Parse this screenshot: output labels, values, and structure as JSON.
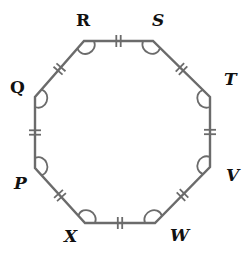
{
  "diagram": {
    "type": "regular-octagon",
    "stroke_color": "#6b6b6b",
    "label_color": "#111111",
    "vertices": [
      {
        "label": "R",
        "x": 84,
        "y": 41,
        "lx": 76,
        "ly": 26,
        "italic": false
      },
      {
        "label": "S",
        "x": 153,
        "y": 41,
        "lx": 152,
        "ly": 26,
        "italic": true
      },
      {
        "label": "T",
        "x": 210,
        "y": 97,
        "lx": 224,
        "ly": 85,
        "italic": true
      },
      {
        "label": "V",
        "x": 210,
        "y": 167,
        "lx": 226,
        "ly": 181,
        "italic": true
      },
      {
        "label": "W",
        "x": 155,
        "y": 223,
        "lx": 170,
        "ly": 241,
        "italic": true
      },
      {
        "label": "X",
        "x": 85,
        "y": 223,
        "lx": 64,
        "ly": 242,
        "italic": true
      },
      {
        "label": "P",
        "x": 35,
        "y": 168,
        "lx": 14,
        "ly": 189,
        "italic": true
      },
      {
        "label": "Q",
        "x": 35,
        "y": 97,
        "lx": 10,
        "ly": 93,
        "italic": false
      }
    ],
    "side_marks": "double-tick",
    "angle_marks": "arc-at-every-vertex"
  }
}
